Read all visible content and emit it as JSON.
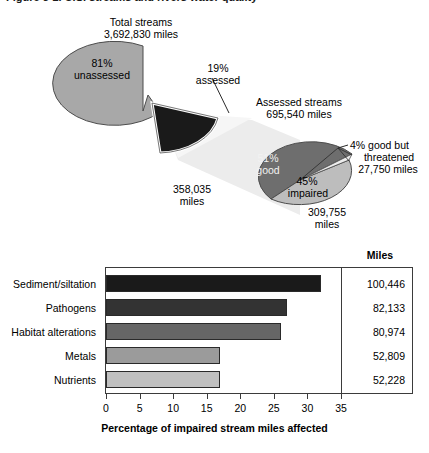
{
  "figure": {
    "caption_partial": "Figure 3-2.  U.S. streams and rivers water quality"
  },
  "pie1": {
    "title_line1": "Total streams",
    "title_line2": "3,692,830 miles",
    "slices": [
      {
        "label_line1": "81%",
        "label_line2": "unassessed",
        "percent": 81,
        "color": "#a8a8a8"
      },
      {
        "label_line1": "19%",
        "label_line2": "assessed",
        "percent": 19,
        "color": "#1a1a1a"
      }
    ]
  },
  "pie2": {
    "title_line1": "Assessed streams",
    "title_line2": "695,540 miles",
    "slices": [
      {
        "label_line1": "51%",
        "label_line2": "good",
        "percent": 51,
        "color": "#6e6e6e",
        "value_line1": "358,035",
        "value_line2": "miles"
      },
      {
        "label_line1": "45%",
        "label_line2": "impaired",
        "percent": 45,
        "color": "#bdbdbd",
        "value_line1": "309,755",
        "value_line2": "miles"
      },
      {
        "label_line1": "4% good but",
        "label_line2": "threatened",
        "percent": 4,
        "color": "#e8e8e8",
        "value_line1": "27,750 miles",
        "value_line2": ""
      }
    ]
  },
  "chart_data": {
    "type": "bar",
    "orientation": "horizontal",
    "title": "",
    "xlabel": "Percentage of impaired stream miles affected",
    "ylabel": "",
    "xlim": [
      0,
      35
    ],
    "xticks": [
      "0",
      "5",
      "10",
      "15",
      "20",
      "25",
      "30",
      "35"
    ],
    "grid": false,
    "legend": "none",
    "categories": [
      "Sediment/siltation",
      "Pathogens",
      "Habitat alterations",
      "Metals",
      "Nutrients"
    ],
    "values": [
      32,
      27,
      26,
      17,
      17
    ],
    "bar_colors": [
      "#1a1a1a",
      "#333333",
      "#666666",
      "#9b9b9b",
      "#c0c0c0"
    ],
    "extra_column": {
      "header": "Miles",
      "values": [
        "100,446",
        "82,133",
        "80,974",
        "52,809",
        "52,228"
      ]
    }
  }
}
